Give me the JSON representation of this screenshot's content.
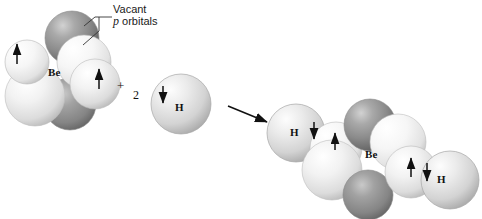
{
  "figure": {
    "type": "orbital-hybridization-reaction-diagram",
    "background_color": "#ffffff"
  },
  "annotations": {
    "vacant_p_line1": "Vacant",
    "vacant_p_italic": "p",
    "vacant_p_line2": " orbitals"
  },
  "reactants": {
    "beryllium": {
      "symbol": "Be",
      "electron_arrows": [
        "up",
        "up"
      ]
    },
    "plus_sign": "+",
    "coefficient": "2",
    "hydrogen": {
      "symbol": "H",
      "electron_arrows": [
        "down"
      ]
    }
  },
  "products": {
    "molecule": "BeH2",
    "beryllium": {
      "symbol": "Be"
    },
    "hydrogen_left": {
      "symbol": "H"
    },
    "hydrogen_right": {
      "symbol": "H"
    },
    "bond_pair_left": [
      "down",
      "up"
    ],
    "bond_pair_right": [
      "up",
      "down"
    ]
  },
  "colors": {
    "dark_orbital": "#8e8e8e",
    "dark_orbital_shadow": "#6a6a6a",
    "light_orbital": "#e9e9e9",
    "light_orbital_shadow": "#bdbdbd",
    "hydrogen_sphere": "#dcdcdc",
    "outline": "#9a9a9a",
    "arrow": "#111111",
    "text": "#111111"
  }
}
